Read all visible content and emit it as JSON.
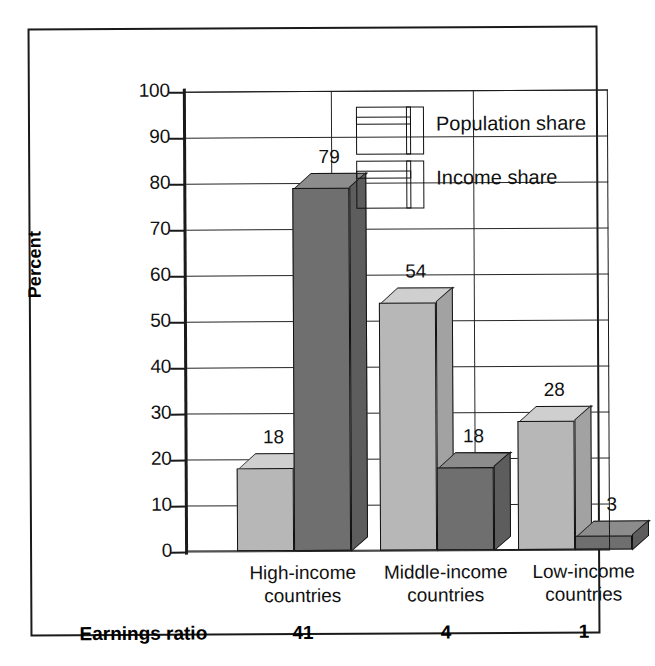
{
  "chart_data": {
    "type": "bar",
    "title": "",
    "subtitle": "",
    "xlabel": "",
    "ylabel": "Percent",
    "ylim": [
      0,
      100
    ],
    "ytick_step": 10,
    "yticks": [
      "100",
      "90",
      "80",
      "70",
      "60",
      "50",
      "40",
      "30",
      "20",
      "10",
      "0"
    ],
    "grid": "horizontal-and-group-separators",
    "legend_position": "inside-top-center-right",
    "style": "3d-grouped-columns",
    "categories": [
      "High-income countries",
      "Middle-income countries",
      "Low-income countries"
    ],
    "category_lines": [
      [
        "High-income",
        "countries"
      ],
      [
        "Middle-income",
        "countries"
      ],
      [
        "Low-income",
        "countries"
      ]
    ],
    "series": [
      {
        "name": "Population share",
        "values": [
          18,
          54,
          28
        ],
        "color": "#b7b7b7"
      },
      {
        "name": "Income share",
        "values": [
          79,
          18,
          3
        ],
        "color": "#6f6f6f"
      }
    ],
    "data_labels": [
      [
        "18",
        "54",
        "28"
      ],
      [
        "79",
        "18",
        "3"
      ]
    ],
    "footer_row": {
      "label": "Earnings ratio",
      "values": [
        "41",
        "4",
        "1"
      ]
    }
  },
  "legend": {
    "items": [
      {
        "label": "Population share",
        "swatch": "light-gray-cube"
      },
      {
        "label": "Income share",
        "swatch": "dark-gray-cube"
      }
    ]
  },
  "axis": {
    "y_title": "Percent"
  },
  "colors": {
    "population_face": "#b7b7b7",
    "population_top": "#cfcfcf",
    "population_side": "#a2a2a2",
    "income_face": "#6f6f6f",
    "income_top": "#8c8c8c",
    "income_side": "#5d5d5d",
    "line": "#1a1a1a",
    "background": "#ffffff"
  }
}
